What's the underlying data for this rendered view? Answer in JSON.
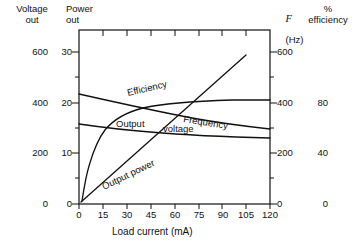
{
  "headers": {
    "left_axis": "Voltage\nout",
    "power_axis": "Power\nout",
    "freq_axis_symbol": "F",
    "freq_axis_unit": "(Hz)",
    "efficiency_axis": "%\nefficiency"
  },
  "chart_data": {
    "type": "line",
    "title": "",
    "xlabel": "Load current (mA)",
    "x_ticks": [
      0,
      15,
      30,
      45,
      60,
      75,
      90,
      105,
      120
    ],
    "xlim": [
      0,
      120
    ],
    "grid": false,
    "legend": "inline-curve-labels",
    "axes": [
      {
        "name": "Voltage out",
        "ticks": [
          0,
          200,
          400,
          600
        ],
        "lim": [
          0,
          700
        ],
        "side": "left-outer",
        "unit": ""
      },
      {
        "name": "Power out",
        "ticks": [
          0,
          10,
          20,
          30
        ],
        "lim": [
          0,
          35
        ],
        "side": "left-inner",
        "unit": ""
      },
      {
        "name": "F (Hz)",
        "ticks": [
          0,
          200,
          400,
          600
        ],
        "lim": [
          0,
          700
        ],
        "side": "right-inner",
        "unit": "Hz"
      },
      {
        "name": "% efficiency",
        "ticks": [
          0,
          40,
          80
        ],
        "lim": [
          0,
          140
        ],
        "side": "right-outer",
        "unit": "%"
      }
    ],
    "series": [
      {
        "name": "Efficiency",
        "label": "Efficiency",
        "axis": "% efficiency",
        "x": [
          0,
          5,
          10,
          15,
          20,
          25,
          30,
          40,
          50,
          60,
          75,
          90,
          105,
          120
        ],
        "values": [
          6,
          22,
          38,
          50,
          58,
          64,
          69,
          76,
          80,
          83,
          86,
          88,
          89,
          90
        ]
      },
      {
        "name": "Frequency",
        "label": "Frequency",
        "axis": "F (Hz)",
        "x": [
          0,
          30,
          60,
          90,
          120
        ],
        "values": [
          440,
          408,
          376,
          344,
          312
        ]
      },
      {
        "name": "Output voltage",
        "label": "Output voltage",
        "axis": "Voltage out",
        "x": [
          0,
          15,
          30,
          45,
          60,
          75,
          90,
          105,
          120
        ],
        "values": [
          320,
          314,
          306,
          298,
          291,
          285,
          280,
          277,
          275
        ]
      },
      {
        "name": "Output power",
        "label": "Output power",
        "axis": "Power out",
        "x": [
          0,
          15,
          30,
          45,
          60,
          75,
          90,
          105
        ],
        "values": [
          0.4,
          4.3,
          8.4,
          12.6,
          16.8,
          21.2,
          25.6,
          30.5
        ]
      }
    ]
  }
}
